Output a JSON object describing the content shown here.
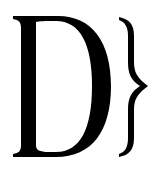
{
  "logo": {
    "text": "D}",
    "letter": "D",
    "brace": "}",
    "colors": {
      "foreground": "#000000",
      "background": "#ffffff"
    }
  }
}
